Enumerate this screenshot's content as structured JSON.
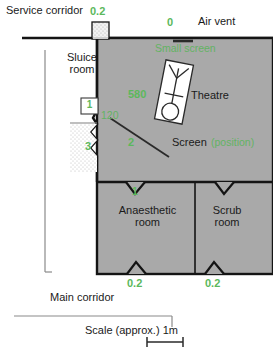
{
  "diagram": {
    "type": "floor-plan",
    "colors": {
      "room_fill": "#a9a9a9",
      "wall": "#141414",
      "annotation_green": "#63b363",
      "text_black": "#1a1a1a",
      "background": "#ffffff",
      "door_fill": "#efefef"
    }
  },
  "labels": {
    "service_corridor": "Service corridor",
    "air_vent": "Air vent",
    "small_screen": "Small screen",
    "sluice_room_line1": "Sluice",
    "sluice_room_line2": "room",
    "theatre": "Theatre",
    "screen": "Screen",
    "screen_position": "(position)",
    "anaesthetic_room_line1": "Anaesthetic",
    "anaesthetic_room_line2": "room",
    "scrub_room_line1": "Scrub",
    "scrub_room_line2": "room",
    "main_corridor": "Main corridor",
    "scale": "Scale (approx.) 1m"
  },
  "annotations": {
    "top_left_door": "0.2",
    "air_vent_value": "0",
    "sluice_door_box": "1",
    "theatre_centre": "580",
    "wall_left": "120",
    "sluice_hatch": "3",
    "screen_marker": "2",
    "theatre_bottom_door": "1",
    "anaesthetic_bottom_door": "0.2",
    "scrub_bottom_door": "0.2"
  },
  "annotation_units": {
    "description": "green numbers are measured values at marked positions"
  }
}
